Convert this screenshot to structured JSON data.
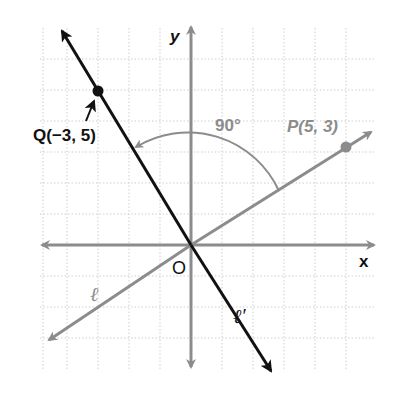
{
  "diagram": {
    "type": "coordinate-plane",
    "grid": {
      "x_range": [
        -5,
        6
      ],
      "y_range": [
        -4,
        6
      ],
      "unit_px": 31,
      "origin_px": [
        191,
        245
      ]
    },
    "axes": {
      "x_label": "x",
      "y_label": "y",
      "origin_label": "O"
    },
    "points": [
      {
        "name": "Q",
        "label": "Q(−3, 5)",
        "x": -3,
        "y": 5
      },
      {
        "name": "P",
        "label": "P(5, 3)",
        "x": 5,
        "y": 3
      }
    ],
    "lines": [
      {
        "name": "l",
        "label": "ℓ",
        "through": "P",
        "color": "#888888"
      },
      {
        "name": "l-prime",
        "label": "ℓ′",
        "through": "Q",
        "color": "#111111"
      }
    ],
    "angle": {
      "label": "90°",
      "from": "P",
      "to": "Q"
    },
    "colors": {
      "axis": "#8c8c8c",
      "grid": "#cfcfcf",
      "line_l": "#888888",
      "line_l_prime": "#111111"
    }
  }
}
